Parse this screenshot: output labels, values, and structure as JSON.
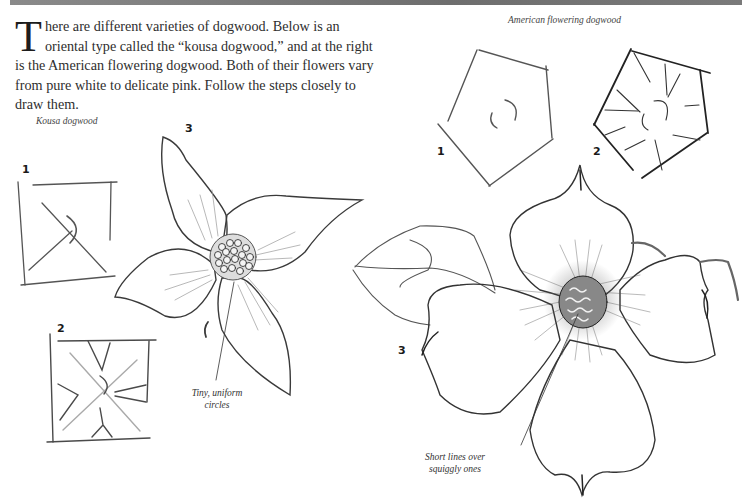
{
  "page": {
    "intro": {
      "dropcap": "T",
      "text": "here are different varieties of dogwood. Below is an oriental type called the “kousa dogwood,” and at the right is the American flowering dogwood. Both of their flowers vary from pure white to delicate pink. Follow the steps closely to draw them."
    },
    "kousa": {
      "caption": "Kousa dogwood",
      "steps": [
        "1",
        "2",
        "3"
      ],
      "note": [
        "Tiny, uniform",
        "circles"
      ]
    },
    "american": {
      "caption": "American flowering dogwood",
      "steps": [
        "1",
        "2",
        "3"
      ],
      "note": [
        "Short lines over",
        "squiggly ones"
      ]
    },
    "colors": {
      "header_bar": "#777777",
      "pencil": "#3a3a3a",
      "paper": "#ffffff"
    }
  }
}
